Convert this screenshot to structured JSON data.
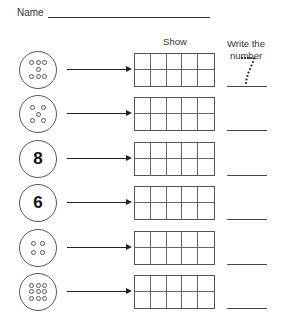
{
  "header": {
    "name_label": "Name"
  },
  "columns": {
    "show": "Show",
    "write_line1": "Write the",
    "write_line2": "number"
  },
  "rows": [
    {
      "type": "dots",
      "count": 7,
      "pattern": "3-1-3",
      "answer_trace": "7"
    },
    {
      "type": "dots",
      "count": 5,
      "pattern": "dice-5"
    },
    {
      "type": "numeral",
      "value": "8"
    },
    {
      "type": "numeral",
      "value": "6"
    },
    {
      "type": "dots",
      "count": 4,
      "pattern": "2x2"
    },
    {
      "type": "dots",
      "count": 9,
      "pattern": "3x3"
    }
  ],
  "ten_frame": {
    "columns": 5,
    "rows": 2
  }
}
